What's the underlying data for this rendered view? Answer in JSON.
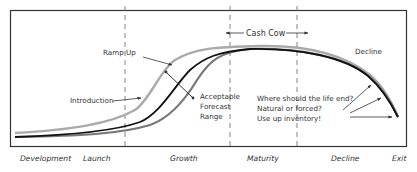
{
  "diagram": {
    "annotations": {
      "ramp_up": "Ramp Up",
      "introduction": "Introduction",
      "acceptable_line1": "Acceptable",
      "acceptable_line2": "Forecast",
      "acceptable_line3": "Range",
      "cash_cow": "Cash Cow",
      "decline_top": "Decline",
      "question_line1": "Where should the life end?",
      "question_line2": "Natural or forced?",
      "question_line3": "Use up inventory!"
    },
    "phases": [
      {
        "label": "Development"
      },
      {
        "label": "Launch"
      },
      {
        "label": "Growth"
      },
      {
        "label": "Maturity"
      },
      {
        "label": "Decline"
      },
      {
        "label": "Exit"
      }
    ],
    "curves": [
      {
        "name": "optimistic",
        "color": "#aaaaaa"
      },
      {
        "name": "expected",
        "color": "#111111"
      },
      {
        "name": "pessimistic",
        "color": "#777777"
      }
    ],
    "colors": {
      "frame": "#333333",
      "divider": "#666666",
      "arrow": "#333333"
    }
  }
}
